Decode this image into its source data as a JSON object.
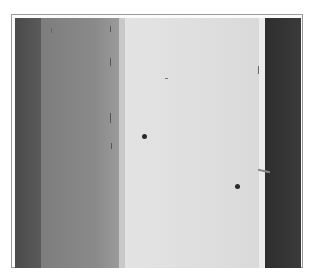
{
  "image": {
    "type": "grayscale photograph",
    "description": "Scanned grayscale image with vertical tonal bands (dark left strip, mid-gray band, light central band, dark right strip) inside a thin frame; small dark spots on light band",
    "colors": {
      "frame": "#9a9a9a",
      "dark_left": "#4a4a4a",
      "mid_gray": "#858585",
      "light_center": "#e0e0e0",
      "dark_right": "#333333",
      "spots": "#2a2a2a"
    }
  }
}
